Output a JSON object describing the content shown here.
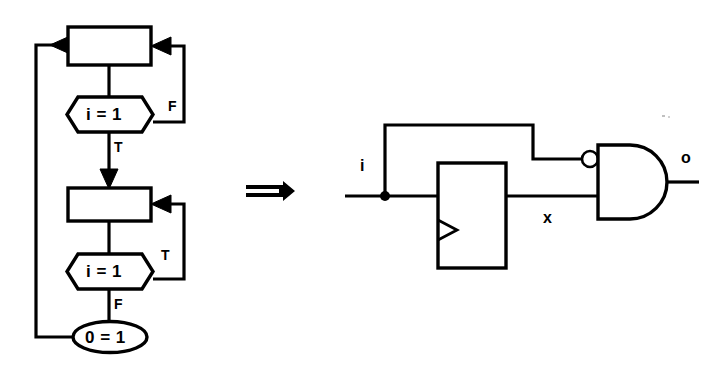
{
  "figure": {
    "background_color": "#ffffff",
    "stroke_color": "#000000",
    "width": 722,
    "height": 371,
    "implication_symbol": "⇒"
  },
  "flowchart": {
    "name": "nested-loop-flowchart",
    "process_boxes": [
      {
        "id": "process-top",
        "label": ""
      },
      {
        "id": "process-bottom",
        "label": ""
      }
    ],
    "decisions": [
      {
        "id": "decision-top",
        "condition": "i = 1",
        "true_label": "T",
        "false_label": "F"
      },
      {
        "id": "decision-bottom",
        "condition": "i = 1",
        "true_label": "T",
        "false_label": "F"
      }
    ],
    "terminal": {
      "id": "terminal-assert",
      "label": "0 = 1"
    },
    "branch_labels": {
      "top_false": "F",
      "top_true": "T",
      "bottom_true": "T",
      "bottom_false": "F"
    }
  },
  "circuit": {
    "name": "latch-and-gate-circuit",
    "input_label": "i",
    "output_label": "o",
    "internal_signal_label": "x",
    "gate": {
      "id": "and-gate",
      "type": "AND",
      "inverted_input": true
    },
    "register": {
      "id": "d-flip-flop",
      "type": "flip-flop",
      "clock_edge_triangle": true
    }
  }
}
